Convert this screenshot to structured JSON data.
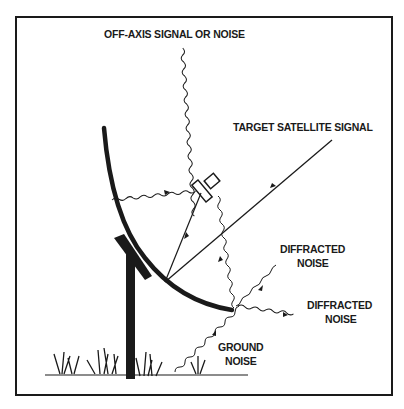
{
  "diagram": {
    "type": "satellite-dish-signal-diagram",
    "labels": {
      "off_axis": "OFF-AXIS SIGNAL OR NOISE",
      "target": "TARGET SATELLITE SIGNAL",
      "diffracted_1_line1": "DIFFRACTED",
      "diffracted_1_line2": "NOISE",
      "diffracted_2_line1": "DIFFRACTED",
      "diffracted_2_line2": "NOISE",
      "ground_line1": "GROUND",
      "ground_line2": "NOISE"
    },
    "colors": {
      "ink": "#1a1a1a",
      "background": "#ffffff"
    }
  }
}
